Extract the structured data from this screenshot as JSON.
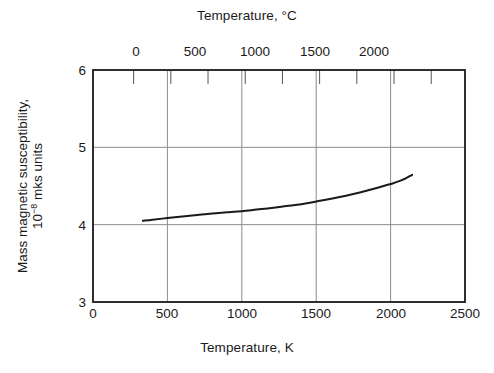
{
  "chart_data": {
    "type": "line",
    "title": "",
    "xlabel": "Temperature, K",
    "ylabel": "Mass magnetic susceptibility, 10−8 mks units",
    "ylabel_line1": "Mass magnetic susceptibility,",
    "ylabel_line2_pre": "10",
    "ylabel_line2_sup": "−8",
    "ylabel_line2_post": " mks units",
    "secondary_xlabel": "Temperature, °C",
    "xlim": [
      0,
      2500
    ],
    "ylim": [
      3,
      6
    ],
    "secondary_xlim": [
      -273,
      2227
    ],
    "xticks": [
      0,
      500,
      1000,
      1500,
      2000,
      2500
    ],
    "xticklabels": [
      "0",
      "500",
      "1000",
      "1500",
      "2000",
      "2500"
    ],
    "yticks": [
      3,
      4,
      5,
      6
    ],
    "yticklabels": [
      "3",
      "4",
      "5",
      "6"
    ],
    "secondary_xticks": [
      0,
      500,
      1000,
      1500,
      2000
    ],
    "secondary_xticklabels": [
      "0",
      "500",
      "1000",
      "1500",
      "2000"
    ],
    "secondary_minor_xticks": [
      250,
      750,
      1250,
      1750,
      2250
    ],
    "grid": true,
    "grid_axis": "both",
    "grid_color": "#8c8c8c",
    "line_color": "#1a1a1a",
    "line_width": 2.0,
    "series": [
      {
        "name": "Mass magnetic susceptibility vs temperature",
        "x": [
          335,
          400,
          500,
          600,
          700,
          800,
          900,
          1000,
          1100,
          1200,
          1300,
          1400,
          1500,
          1600,
          1700,
          1800,
          1900,
          2000,
          2075,
          2145
        ],
        "y": [
          4.05,
          4.065,
          4.085,
          4.105,
          4.125,
          4.145,
          4.16,
          4.175,
          4.195,
          4.215,
          4.24,
          4.265,
          4.3,
          4.335,
          4.375,
          4.42,
          4.47,
          4.525,
          4.575,
          4.645
        ]
      }
    ]
  },
  "axes": {
    "top_title": "Temperature, °C",
    "bottom_title": "Temperature, K"
  }
}
